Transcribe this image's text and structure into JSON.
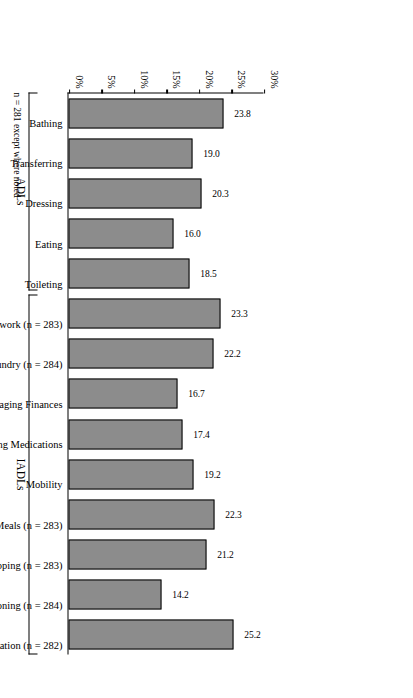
{
  "chart_data": {
    "type": "bar",
    "title": "",
    "xlabel": "",
    "ylabel": "",
    "ylim": [
      0,
      30
    ],
    "yticks": [
      "0%",
      "5%",
      "10%",
      "15%",
      "20%",
      "25%",
      "30%"
    ],
    "ytick_values": [
      0,
      5,
      10,
      15,
      20,
      25,
      30
    ],
    "grid": false,
    "legend": false,
    "orientation": "vertical-bars-rotated-page",
    "categories": [
      "Bathing",
      "Transferring",
      "Dressing",
      "Eating",
      "Toileting",
      "Housework (n = 283)",
      "Laundry (n = 284)",
      "Managing Finances",
      "Managing Medications",
      "Mobility",
      "Preparing Meals (n = 283)",
      "Shopping (n = 283)",
      "Telephoning (n = 284)",
      "Transportation (n = 282)"
    ],
    "values": [
      23.8,
      19.0,
      20.3,
      16.0,
      18.5,
      23.3,
      22.2,
      16.7,
      17.4,
      19.2,
      22.3,
      21.2,
      14.2,
      25.2
    ],
    "value_labels": [
      "23.8",
      "19.0",
      "20.3",
      "16.0",
      "18.5",
      "23.3",
      "22.2",
      "16.7",
      "17.4",
      "19.2",
      "22.3",
      "21.2",
      "14.2",
      "25.2"
    ],
    "groups": [
      {
        "label": "ADLs",
        "start": 0,
        "end": 4
      },
      {
        "label": "IADLs",
        "start": 5,
        "end": 13
      }
    ],
    "footnote": "n = 281 except where noted"
  }
}
